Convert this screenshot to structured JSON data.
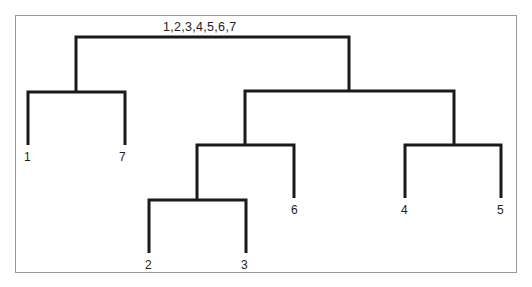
{
  "diagram": {
    "type": "dendrogram",
    "clipped_caption": "",
    "root": {
      "label": "1,2,3,4,5,6,7",
      "children": [
        {
          "label": "",
          "children": [
            {
              "label": "1"
            },
            {
              "label": "7"
            }
          ]
        },
        {
          "label": "",
          "children": [
            {
              "label": "",
              "children": [
                {
                  "label": "",
                  "children": [
                    {
                      "label": "2"
                    },
                    {
                      "label": "3"
                    }
                  ]
                },
                {
                  "label": "6"
                }
              ]
            },
            {
              "label": "",
              "children": [
                {
                  "label": "4"
                },
                {
                  "label": "5"
                }
              ]
            }
          ]
        }
      ]
    },
    "leaves": {
      "l1": "1",
      "l7": "7",
      "l2": "2",
      "l3": "3",
      "l6": "6",
      "l4": "4",
      "l5": "5"
    },
    "line_color": "#1a1a1a",
    "frame_color": "#9a9a9a"
  }
}
